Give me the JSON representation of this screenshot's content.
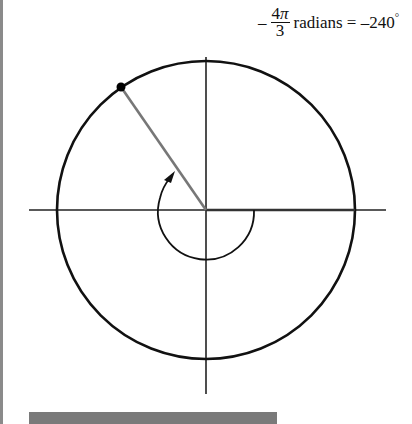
{
  "diagram": {
    "type": "unit-circle-angle",
    "label": {
      "sign": "–",
      "numerator_coef": "4",
      "numerator_symbol": "π",
      "denominator": "3",
      "text": "radians = –240",
      "degree_symbol": "°"
    },
    "angle_radians": "-4π/3",
    "angle_degrees": -240,
    "colors": {
      "circle": "#111111",
      "axes": "#222222",
      "terminal_ray": "#777777",
      "arc": "#111111",
      "point": "#000000"
    }
  }
}
